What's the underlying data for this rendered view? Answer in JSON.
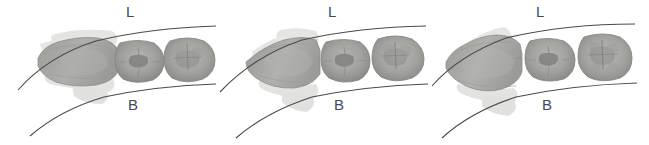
{
  "figure": {
    "width": 649,
    "height": 145,
    "background_color": "#ffffff",
    "panel_count": 3
  },
  "labels": {
    "lingual": "L",
    "buccal": "B"
  },
  "colors": {
    "background": "#ffffff",
    "tooth_mid_gray": "#a9a9a7",
    "tooth_light_gray": "#c4c4c1",
    "tooth_dark_gray": "#8a8a88",
    "tooth_shadow": "#6f6f6d",
    "overlay_gray": "#cfcfcc",
    "outline_gray": "#5a5a58",
    "arch_line": "#4a4a48",
    "label_text": "#4a4a4a"
  },
  "panels": [
    {
      "id": "panel-1",
      "index": 1,
      "x": 0,
      "label_L": "L",
      "label_L_x": 126,
      "label_B": "B",
      "label_B_x": 128,
      "teeth": [
        {
          "name": "premolar-left",
          "type": "premolar",
          "position": 1
        },
        {
          "name": "molar-first",
          "type": "molar",
          "position": 2
        },
        {
          "name": "molar-second",
          "type": "molar",
          "position": 3
        }
      ],
      "arch_lines": [
        {
          "name": "lingual-arch-line",
          "side": "lingual"
        },
        {
          "name": "buccal-arch-line",
          "side": "buccal"
        }
      ]
    },
    {
      "id": "panel-2",
      "index": 2,
      "x": 216,
      "label_L": "L",
      "label_L_x": 112,
      "label_B": "B",
      "label_B_x": 118,
      "teeth": [
        {
          "name": "premolar-left",
          "type": "premolar",
          "position": 1
        },
        {
          "name": "molar-first",
          "type": "molar",
          "position": 2
        },
        {
          "name": "molar-second",
          "type": "molar",
          "position": 3
        }
      ],
      "arch_lines": [
        {
          "name": "lingual-arch-line",
          "side": "lingual"
        },
        {
          "name": "buccal-arch-line",
          "side": "buccal"
        }
      ]
    },
    {
      "id": "panel-3",
      "index": 3,
      "x": 432,
      "label_L": "L",
      "label_L_x": 104,
      "label_B": "B",
      "label_B_x": 110,
      "teeth": [
        {
          "name": "premolar-left",
          "type": "premolar",
          "position": 1
        },
        {
          "name": "molar-first",
          "type": "molar",
          "position": 2
        },
        {
          "name": "molar-second",
          "type": "molar",
          "position": 3
        }
      ],
      "arch_lines": [
        {
          "name": "lingual-arch-line",
          "side": "lingual"
        },
        {
          "name": "buccal-arch-line",
          "side": "buccal"
        }
      ]
    }
  ]
}
